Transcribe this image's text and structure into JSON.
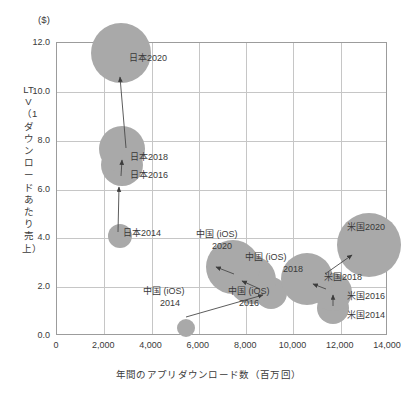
{
  "chart_data": {
    "type": "scatter",
    "title": "",
    "unit_label": "($)",
    "xlabel": "年間のアプリダウンロード数（百万回）",
    "ylabel": "LTV（1ダウンロードあたり売上）",
    "xlim": [
      0,
      14000
    ],
    "ylim": [
      0.0,
      12.0
    ],
    "xticks": [
      "0",
      "2,000",
      "4,000",
      "6,000",
      "8,000",
      "10,000",
      "12,000",
      "14,000"
    ],
    "xtick_values": [
      0,
      2000,
      4000,
      6000,
      8000,
      10000,
      12000,
      14000
    ],
    "yticks": [
      "0.0",
      "2.0",
      "4.0",
      "6.0",
      "8.0",
      "10.0",
      "12.0"
    ],
    "ytick_values": [
      0.0,
      2.0,
      4.0,
      6.0,
      8.0,
      10.0,
      12.0
    ],
    "grid": true,
    "legend": "none",
    "bubble_color": "#a9a9a9",
    "arrow_color": "#4a4a4a",
    "series": [
      {
        "name": "日本",
        "points": [
          {
            "label": "日本2014",
            "x": 2700,
            "y": 4.05,
            "size": 12
          },
          {
            "label": "日本2016",
            "x": 2800,
            "y": 6.95,
            "size": 21
          },
          {
            "label": "日本2018",
            "x": 2800,
            "y": 7.6,
            "size": 23
          },
          {
            "label": "日本2020",
            "x": 2750,
            "y": 11.55,
            "size": 30
          }
        ]
      },
      {
        "name": "中国（iOS）",
        "points": [
          {
            "label": "中国 (iOS)\n2014",
            "x": 5500,
            "y": 0.3,
            "size": 9
          },
          {
            "label": "中国 (iOS)\n2016",
            "x": 9100,
            "y": 1.7,
            "size": 16
          },
          {
            "label": "中国 (iOS)\n2018",
            "x": 8300,
            "y": 2.25,
            "size": 24
          },
          {
            "label": "中国 (iOS)\n2020",
            "x": 7500,
            "y": 2.8,
            "size": 27
          }
        ]
      },
      {
        "name": "米国",
        "points": [
          {
            "label": "米国2014",
            "x": 11700,
            "y": 1.1,
            "size": 16
          },
          {
            "label": "米国2016",
            "x": 11700,
            "y": 1.75,
            "size": 19
          },
          {
            "label": "米国2018",
            "x": 10600,
            "y": 2.3,
            "size": 26
          },
          {
            "label": "米国2020",
            "x": 13250,
            "y": 3.7,
            "size": 32
          }
        ]
      }
    ],
    "arrows": [
      {
        "from": "日本2014",
        "to": "日本2016",
        "x1": 118,
        "y1": 232,
        "x2": 119,
        "y2": 187
      },
      {
        "from": "日本2016",
        "to": "日本2018",
        "x1": 121,
        "y1": 176,
        "x2": 122,
        "y2": 160
      },
      {
        "from": "日本2018",
        "to": "日本2020",
        "x1": 126,
        "y1": 148,
        "x2": 120,
        "y2": 77
      },
      {
        "from": "中国2014",
        "to": "中国2016",
        "x1": 186,
        "y1": 317,
        "x2": 263,
        "y2": 295
      },
      {
        "from": "中国2016",
        "to": "中国2018",
        "x1": 260,
        "y1": 289,
        "x2": 242,
        "y2": 281
      },
      {
        "from": "中国2018",
        "to": "中国2020",
        "x1": 234,
        "y1": 274,
        "x2": 216,
        "y2": 267
      },
      {
        "from": "米国2014",
        "to": "米国2016",
        "x1": 333,
        "y1": 306,
        "x2": 333,
        "y2": 295
      },
      {
        "from": "米国2016",
        "to": "米国2018",
        "x1": 326,
        "y1": 289,
        "x2": 313,
        "y2": 284
      },
      {
        "from": "米国2018",
        "to": "米国2020",
        "x1": 325,
        "y1": 274,
        "x2": 352,
        "y2": 255
      }
    ],
    "point_labels": [
      {
        "text": "日本2020",
        "left": 129,
        "top": 53,
        "align": "left"
      },
      {
        "text": "日本2018",
        "left": 130,
        "top": 152,
        "align": "left"
      },
      {
        "text": "日本2016",
        "left": 130,
        "top": 170,
        "align": "left"
      },
      {
        "text": "日本2014",
        "left": 123,
        "top": 228,
        "align": "left"
      },
      {
        "text": "中国 (iOS)",
        "left": 196,
        "top": 229,
        "align": "left"
      },
      {
        "text": "2020",
        "left": 212,
        "top": 241,
        "align": "left"
      },
      {
        "text": "中国 (iOS)",
        "left": 245,
        "top": 252,
        "align": "left"
      },
      {
        "text": "2018",
        "left": 283,
        "top": 264,
        "align": "left"
      },
      {
        "text": "中国 (iOS)",
        "left": 228,
        "top": 286,
        "align": "left"
      },
      {
        "text": "2016",
        "left": 239,
        "top": 298,
        "align": "left"
      },
      {
        "text": "中国 (iOS)",
        "left": 143,
        "top": 286,
        "align": "left"
      },
      {
        "text": "2014",
        "left": 160,
        "top": 298,
        "align": "left"
      },
      {
        "text": "米国2020",
        "left": 347,
        "top": 222,
        "align": "left"
      },
      {
        "text": "米国2018",
        "left": 324,
        "top": 272,
        "align": "left"
      },
      {
        "text": "米国2016",
        "left": 347,
        "top": 291,
        "align": "left"
      },
      {
        "text": "米国2014",
        "left": 347,
        "top": 310,
        "align": "left"
      }
    ]
  }
}
